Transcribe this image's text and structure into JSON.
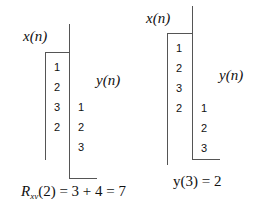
{
  "left": {
    "x_label": "x(n)",
    "y_label": "y(n)",
    "x_values": [
      "1",
      "2",
      "3",
      "2"
    ],
    "y_values": [
      "1",
      "2",
      "3"
    ],
    "equation": {
      "prefix": "R",
      "subscript": "xy",
      "rest": "(2) = 3 + 4 = 7"
    }
  },
  "right": {
    "x_label": "x(n)",
    "y_label": "y(n)",
    "x_values": [
      "1",
      "2",
      "3",
      "2"
    ],
    "y_values": [
      "1",
      "2",
      "3"
    ],
    "equation": "y(3) = 2"
  }
}
